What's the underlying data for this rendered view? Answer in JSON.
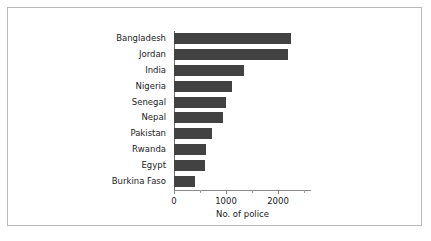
{
  "chart_data": {
    "type": "bar",
    "orientation": "horizontal",
    "title": "",
    "xlabel": "No. of police",
    "ylabel": "",
    "xlim": [
      0,
      2635
    ],
    "grid": false,
    "legend": null,
    "bar_color": "#424242",
    "categories": [
      "Bangladesh",
      "Jordan",
      "India",
      "Nigeria",
      "Senegal",
      "Nepal",
      "Pakistan",
      "Rwanda",
      "Egypt",
      "Burkina Faso"
    ],
    "values": [
      2250,
      2200,
      1350,
      1120,
      1000,
      940,
      730,
      620,
      590,
      400
    ],
    "xticks": [
      {
        "value": 0,
        "label": "0",
        "major": true
      },
      {
        "value": 500,
        "label": "",
        "major": false
      },
      {
        "value": 1000,
        "label": "1000",
        "major": true
      },
      {
        "value": 1500,
        "label": "",
        "major": false
      },
      {
        "value": 2000,
        "label": "2000",
        "major": true
      },
      {
        "value": 2500,
        "label": "",
        "major": false
      }
    ]
  }
}
